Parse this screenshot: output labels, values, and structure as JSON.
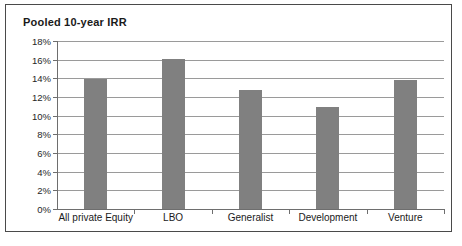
{
  "chart_data": {
    "type": "bar",
    "title": "Pooled 10-year IRR",
    "xlabel": "",
    "ylabel": "",
    "categories": [
      "All private Equity",
      "LBO",
      "Generalist",
      "Development",
      "Venture"
    ],
    "values": [
      13.9,
      16.1,
      12.8,
      10.9,
      13.85
    ],
    "ylim": [
      0,
      18
    ],
    "ytick_step": 2,
    "ytick_labels": [
      "0%",
      "2%",
      "4%",
      "6%",
      "8%",
      "10%",
      "12%",
      "14%",
      "16%",
      "18%"
    ],
    "ytick_values": [
      0,
      2,
      4,
      6,
      8,
      10,
      12,
      14,
      16,
      18
    ],
    "grid": true,
    "legend": false,
    "bar_color": "#808080",
    "gridline_color": "#9a9a9a",
    "axis_color": "#6e6e6e",
    "background_color": "#ffffff",
    "border_color": "#4a4a4a"
  }
}
